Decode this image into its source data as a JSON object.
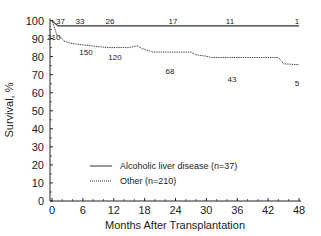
{
  "chart_data": {
    "type": "line",
    "subtype": "kaplan-meier step",
    "title": "",
    "xlabel": "Months After Transplantation",
    "ylabel": "Survival, %",
    "xlim": [
      0,
      48
    ],
    "ylim": [
      0,
      100
    ],
    "xticks": [
      0,
      6,
      12,
      18,
      24,
      30,
      36,
      42,
      48
    ],
    "yticks": [
      0,
      10,
      20,
      30,
      40,
      50,
      60,
      70,
      80,
      90,
      100
    ],
    "grid": false,
    "legend_position": "lower center",
    "series": [
      {
        "name": "Alcoholic liver disease (n=37)",
        "style": "solid",
        "x": [
          0,
          0.5,
          1.2,
          48
        ],
        "y": [
          100,
          98.5,
          97,
          97
        ],
        "at_risk": [
          {
            "month": 0,
            "n": 37
          },
          {
            "month": 6,
            "n": 33
          },
          {
            "month": 12,
            "n": 26
          },
          {
            "month": 24,
            "n": 17
          },
          {
            "month": 36,
            "n": 11
          },
          {
            "month": 48,
            "n": 1
          }
        ]
      },
      {
        "name": "Other (n=210)",
        "style": "dotted",
        "x": [
          0,
          0.6,
          1.0,
          1.8,
          2.4,
          3.5,
          4.5,
          6,
          9,
          11,
          15,
          16.5,
          17.5,
          19.5,
          27,
          28,
          30,
          31,
          44,
          45,
          48
        ],
        "y": [
          100,
          95,
          91.5,
          90.5,
          88.5,
          87.5,
          87,
          86.5,
          85.5,
          85,
          85,
          86,
          84.5,
          82.5,
          82.5,
          81,
          80.2,
          79.5,
          79.5,
          76,
          75.5
        ],
        "at_risk": [
          {
            "month": 0,
            "n": 210
          },
          {
            "month": 6,
            "n": 150
          },
          {
            "month": 12,
            "n": 120
          },
          {
            "month": 24,
            "n": 68
          },
          {
            "month": 36,
            "n": 43
          },
          {
            "month": 48,
            "n": 5
          }
        ]
      }
    ]
  },
  "colors": {
    "line": "#333333",
    "axis": "#222222",
    "background": "#ffffff"
  }
}
